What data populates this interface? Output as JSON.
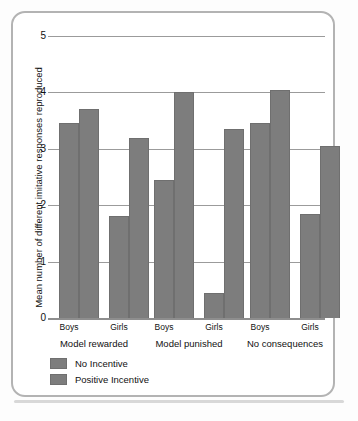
{
  "chart_data": {
    "type": "bar",
    "title": "",
    "subtitle": "",
    "xlabel": "",
    "ylabel": "Mean number of different imitative responses reproduced",
    "ylim": [
      0,
      5
    ],
    "yticks": [
      0,
      1,
      2,
      3,
      4,
      5
    ],
    "ytick_labels": [
      "0",
      "1",
      "2",
      "3",
      "4",
      "5"
    ],
    "grid": "horizontal",
    "legend_position": "below-left",
    "group_labels": [
      "Model rewarded",
      "Model punished",
      "No consequences"
    ],
    "categories": [
      "Model rewarded / Boys",
      "Model rewarded / Girls",
      "Model punished / Boys",
      "Model punished / Girls",
      "No consequences / Boys",
      "No consequences / Girls"
    ],
    "subcategories": [
      "Boys",
      "Girls",
      "Boys",
      "Girls",
      "Boys",
      "Girls"
    ],
    "series": [
      {
        "name": "No Incentive",
        "color": "#7d7d7d",
        "values": [
          3.45,
          1.8,
          2.45,
          0.45,
          3.45,
          1.85
        ]
      },
      {
        "name": "Positive Incentive",
        "color": "#7d7d7d",
        "values": [
          3.7,
          3.2,
          4.0,
          3.35,
          4.05,
          3.05
        ]
      }
    ]
  },
  "axis": {
    "y_title": "Mean number of different imitative responses reproduced",
    "tick_5": "5",
    "tick_4": "4",
    "tick_3": "3",
    "tick_2": "2",
    "tick_1": "1",
    "tick_0": "0"
  },
  "xaxis": {
    "sub": [
      "Boys",
      "Girls",
      "Boys",
      "Girls",
      "Boys",
      "Girls"
    ],
    "groups": [
      "Model rewarded",
      "Model punished",
      "No consequences"
    ]
  },
  "legend": {
    "items": [
      {
        "label": "No Incentive",
        "color": "#7d7d7d"
      },
      {
        "label": "Positive Incentive",
        "color": "#7d7d7d"
      }
    ]
  },
  "colors": {
    "bar_fill": "#7d7d7d",
    "bar_stroke": "#6f6f6f",
    "gridline": "#9b9b9b",
    "frame": "#b3b3b3",
    "background": "#ffffff",
    "text": "#111111"
  }
}
